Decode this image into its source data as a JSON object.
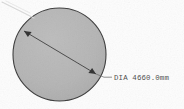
{
  "drawing": {
    "title": "Circular plate diameter detail",
    "background_color": "#fdfdfd",
    "shape": {
      "name": "circle",
      "fill_color": "#b5b5b5",
      "stroke_color": "#3a3a3a",
      "center_x": 59.5,
      "center_y": 54.5,
      "radius": 46.5
    },
    "dimension": {
      "label": "DIA 4660.0mm",
      "prefix": "DIA",
      "value": "4660.0",
      "unit": "mm",
      "text_color": "#4a4a4a",
      "line_color": "#3a3a3a",
      "start_x": 24,
      "start_y": 31,
      "end_x": 96,
      "end_y": 74,
      "leader_end_x": 112,
      "leader_end_y": 77,
      "text_x": 114,
      "text_y": 79.5
    }
  }
}
